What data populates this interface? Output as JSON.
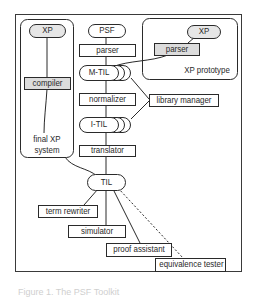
{
  "diagram": {
    "nodes": {
      "xp_left": "XP",
      "compiler": "compiler",
      "final_xp_system_line1": "final XP",
      "final_xp_system_line2": "system",
      "psf": "PSF",
      "parser_center": "parser",
      "m_til": "M-TIL",
      "normalizer": "normalizer",
      "i_til": "I-TIL",
      "translator": "translator",
      "library_manager": "library manager",
      "xp_right": "XP",
      "parser_right": "parser",
      "xp_prototype": "XP prototype",
      "til": "TIL",
      "term_rewriter": "term rewriter",
      "simulator": "simulator",
      "proof_assistant": "proof assistant",
      "equivalence_tester": "equivalence tester"
    },
    "groups": [
      "final XP system",
      "XP prototype"
    ],
    "edges": [
      {
        "from": "XP",
        "to": "compiler",
        "style": "solid"
      },
      {
        "from": "compiler",
        "to": "final XP system",
        "style": "solid"
      },
      {
        "from": "PSF",
        "to": "parser",
        "style": "solid"
      },
      {
        "from": "parser",
        "to": "M-TIL",
        "style": "solid"
      },
      {
        "from": "M-TIL",
        "to": "normalizer",
        "style": "solid"
      },
      {
        "from": "normalizer",
        "to": "I-TIL",
        "style": "solid"
      },
      {
        "from": "I-TIL",
        "to": "translator",
        "style": "solid"
      },
      {
        "from": "translator",
        "to": "TIL",
        "style": "solid"
      },
      {
        "from": "M-TIL",
        "to": "library manager",
        "style": "solid"
      },
      {
        "from": "I-TIL",
        "to": "library manager",
        "style": "solid"
      },
      {
        "from": "XP (prototype)",
        "to": "parser (prototype)",
        "style": "solid"
      },
      {
        "from": "parser (prototype)",
        "to": "M-TIL",
        "style": "solid"
      },
      {
        "from": "final XP system",
        "to": "TIL",
        "style": "solid"
      },
      {
        "from": "TIL",
        "to": "term rewriter",
        "style": "solid"
      },
      {
        "from": "TIL",
        "to": "simulator",
        "style": "solid"
      },
      {
        "from": "TIL",
        "to": "proof assistant",
        "style": "solid"
      },
      {
        "from": "TIL",
        "to": "equivalence tester",
        "style": "dashed"
      }
    ],
    "caption": "Figure 1. The PSF Toolkit"
  },
  "colors": {
    "stroke": "#2a2a2a",
    "pill_fill": "#e6e6e6",
    "shaded_box": "#dcdcdc",
    "box_fill": "#ffffff"
  }
}
